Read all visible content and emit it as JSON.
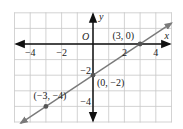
{
  "chart_data": {
    "type": "line",
    "title": "",
    "xlabel": "x",
    "ylabel": "y",
    "origin_label": "O",
    "xlim": [
      -5,
      5
    ],
    "ylim": [
      -5,
      2
    ],
    "grid": true,
    "x_ticks": [
      {
        "value": -4,
        "label": "−4"
      },
      {
        "value": -2,
        "label": "−2"
      },
      {
        "value": 2,
        "label": "2"
      },
      {
        "value": 4,
        "label": "4"
      }
    ],
    "y_ticks": [
      {
        "value": -2,
        "label": "−2"
      },
      {
        "value": -4,
        "label": "−4"
      }
    ],
    "series": [
      {
        "name": "line",
        "equation": "y = (2/3)x - 2",
        "slope": 0.6667,
        "intercept": -2,
        "color": "#777777",
        "extent_x": [
          -4.6,
          5.0
        ]
      }
    ],
    "points": [
      {
        "x": 3,
        "y": 0,
        "label": "(3, 0)"
      },
      {
        "x": 0,
        "y": -2,
        "label": "(0, −2)"
      },
      {
        "x": -3,
        "y": -4,
        "label": "(−3, −4)"
      }
    ]
  },
  "colors": {
    "grid": "#c8c8c8",
    "axis": "#111111",
    "line": "#7a7a7a",
    "point": "#555555"
  }
}
